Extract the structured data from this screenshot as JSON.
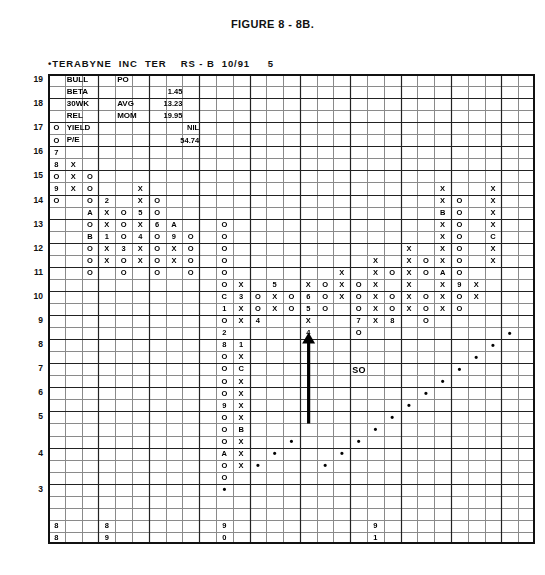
{
  "figure": {
    "title": "FIGURE 8 - 8B."
  },
  "chart_header": {
    "text": "•TERABYNE  INC  TER    RS - B  10/91     5",
    "symbol_marker": "•",
    "company": "TERABYNE",
    "type": "INC",
    "ticker": "TER",
    "relative_strength": "RS - B",
    "date": "10/91",
    "page": "5"
  },
  "stats_panel": {
    "rows": [
      {
        "label": "BULL",
        "mid": "PO",
        "value": ""
      },
      {
        "label": "BETA",
        "mid": "",
        "value": "1.45"
      },
      {
        "label": "30WK",
        "mid": "AVG",
        "value": "13.23"
      },
      {
        "label": "REL",
        "mid": "MOM",
        "value": "19.95"
      },
      {
        "label": "YIELD",
        "mid": "",
        "value": "NIL"
      },
      {
        "label": "P/E",
        "mid": "",
        "value": "54.74"
      }
    ]
  },
  "annotations": {
    "support_label": "SO",
    "arrow": "up-arrow"
  },
  "chart_data": {
    "type": "table",
    "xlabel": "Time (columns)",
    "ylabel": "Price",
    "grid": true,
    "columns": 29,
    "rows": 39,
    "y_axis_ticks": [
      {
        "label": "19",
        "row": 1
      },
      {
        "label": "18",
        "row": 3
      },
      {
        "label": "17",
        "row": 5
      },
      {
        "label": "16",
        "row": 7
      },
      {
        "label": "15",
        "row": 9
      },
      {
        "label": "14",
        "row": 11
      },
      {
        "label": "13",
        "row": 13
      },
      {
        "label": "12",
        "row": 15
      },
      {
        "label": "11",
        "row": 17
      },
      {
        "label": "10",
        "row": 19
      },
      {
        "label": "9",
        "row": 21
      },
      {
        "label": "8",
        "row": 23
      },
      {
        "label": "7",
        "row": 25
      },
      {
        "label": "6",
        "row": 27
      },
      {
        "label": "5",
        "row": 29
      },
      {
        "label": "4",
        "row": 32
      },
      {
        "label": "3",
        "row": 35
      }
    ],
    "year_markers": [
      {
        "col": 1,
        "top": "8",
        "bottom": "8"
      },
      {
        "col": 4,
        "top": "8",
        "bottom": "9"
      },
      {
        "col": 11,
        "top": "9",
        "bottom": "0"
      },
      {
        "col": 20,
        "top": "9",
        "bottom": "1"
      }
    ],
    "marks": [
      {
        "r": 1,
        "c": 2,
        "v": "BULL",
        "w": 2
      },
      {
        "r": 1,
        "c": 5,
        "v": "PO",
        "w": 2
      },
      {
        "r": 2,
        "c": 2,
        "v": "BETA",
        "w": 2
      },
      {
        "r": 2,
        "c": 7,
        "v": "1.45",
        "w": 2,
        "align": "right"
      },
      {
        "r": 3,
        "c": 2,
        "v": "30WK",
        "w": 2
      },
      {
        "r": 3,
        "c": 5,
        "v": "AVG",
        "w": 2
      },
      {
        "r": 3,
        "c": 7,
        "v": "13.23",
        "w": 2,
        "align": "right"
      },
      {
        "r": 4,
        "c": 2,
        "v": "REL",
        "w": 2
      },
      {
        "r": 4,
        "c": 5,
        "v": "MOM",
        "w": 2
      },
      {
        "r": 4,
        "c": 7,
        "v": "19.95",
        "w": 2,
        "align": "right"
      },
      {
        "r": 5,
        "c": 2,
        "v": "YIELD",
        "w": 2
      },
      {
        "r": 5,
        "c": 8,
        "v": "NIL",
        "w": 2,
        "align": "right"
      },
      {
        "r": 6,
        "c": 2,
        "v": "P/E",
        "w": 2
      },
      {
        "r": 6,
        "c": 8,
        "v": "54.74",
        "w": 2,
        "align": "right"
      },
      {
        "r": 5,
        "c": 1,
        "v": "O"
      },
      {
        "r": 6,
        "c": 1,
        "v": "O"
      },
      {
        "r": 7,
        "c": 1,
        "v": "7"
      },
      {
        "r": 8,
        "c": 1,
        "v": "8"
      },
      {
        "r": 8,
        "c": 2,
        "v": "X"
      },
      {
        "r": 9,
        "c": 1,
        "v": "O"
      },
      {
        "r": 9,
        "c": 2,
        "v": "X"
      },
      {
        "r": 9,
        "c": 3,
        "v": "O"
      },
      {
        "r": 10,
        "c": 1,
        "v": "9"
      },
      {
        "r": 10,
        "c": 2,
        "v": "X"
      },
      {
        "r": 10,
        "c": 3,
        "v": "O"
      },
      {
        "r": 10,
        "c": 6,
        "v": "X"
      },
      {
        "r": 11,
        "c": 1,
        "v": "O"
      },
      {
        "r": 11,
        "c": 3,
        "v": "O"
      },
      {
        "r": 11,
        "c": 4,
        "v": "2"
      },
      {
        "r": 11,
        "c": 6,
        "v": "X"
      },
      {
        "r": 11,
        "c": 7,
        "v": "O"
      },
      {
        "r": 12,
        "c": 3,
        "v": "A"
      },
      {
        "r": 12,
        "c": 4,
        "v": "X"
      },
      {
        "r": 12,
        "c": 5,
        "v": "O"
      },
      {
        "r": 12,
        "c": 6,
        "v": "5"
      },
      {
        "r": 12,
        "c": 7,
        "v": "O"
      },
      {
        "r": 13,
        "c": 3,
        "v": "O"
      },
      {
        "r": 13,
        "c": 4,
        "v": "X"
      },
      {
        "r": 13,
        "c": 5,
        "v": "O"
      },
      {
        "r": 13,
        "c": 6,
        "v": "X"
      },
      {
        "r": 13,
        "c": 7,
        "v": "6"
      },
      {
        "r": 13,
        "c": 8,
        "v": "A"
      },
      {
        "r": 14,
        "c": 3,
        "v": "B"
      },
      {
        "r": 14,
        "c": 4,
        "v": "1"
      },
      {
        "r": 14,
        "c": 5,
        "v": "O"
      },
      {
        "r": 14,
        "c": 6,
        "v": "4"
      },
      {
        "r": 14,
        "c": 7,
        "v": "O"
      },
      {
        "r": 14,
        "c": 8,
        "v": "9"
      },
      {
        "r": 14,
        "c": 9,
        "v": "O"
      },
      {
        "r": 15,
        "c": 3,
        "v": "O"
      },
      {
        "r": 15,
        "c": 4,
        "v": "X"
      },
      {
        "r": 15,
        "c": 5,
        "v": "3"
      },
      {
        "r": 15,
        "c": 6,
        "v": "X"
      },
      {
        "r": 15,
        "c": 7,
        "v": "O"
      },
      {
        "r": 15,
        "c": 8,
        "v": "X"
      },
      {
        "r": 15,
        "c": 9,
        "v": "O"
      },
      {
        "r": 16,
        "c": 3,
        "v": "O"
      },
      {
        "r": 16,
        "c": 4,
        "v": "X"
      },
      {
        "r": 16,
        "c": 5,
        "v": "O"
      },
      {
        "r": 16,
        "c": 6,
        "v": "X"
      },
      {
        "r": 16,
        "c": 7,
        "v": "O"
      },
      {
        "r": 16,
        "c": 8,
        "v": "X"
      },
      {
        "r": 16,
        "c": 9,
        "v": "O"
      },
      {
        "r": 17,
        "c": 3,
        "v": "O"
      },
      {
        "r": 17,
        "c": 5,
        "v": "O"
      },
      {
        "r": 17,
        "c": 7,
        "v": "O"
      },
      {
        "r": 17,
        "c": 9,
        "v": "O"
      },
      {
        "r": 10,
        "c": 24,
        "v": "X"
      },
      {
        "r": 10,
        "c": 27,
        "v": "X"
      },
      {
        "r": 11,
        "c": 24,
        "v": "X"
      },
      {
        "r": 11,
        "c": 25,
        "v": "O"
      },
      {
        "r": 11,
        "c": 27,
        "v": "X"
      },
      {
        "r": 12,
        "c": 24,
        "v": "B"
      },
      {
        "r": 12,
        "c": 25,
        "v": "O"
      },
      {
        "r": 12,
        "c": 27,
        "v": "X"
      },
      {
        "r": 13,
        "c": 24,
        "v": "X"
      },
      {
        "r": 13,
        "c": 25,
        "v": "O"
      },
      {
        "r": 13,
        "c": 27,
        "v": "X"
      },
      {
        "r": 14,
        "c": 24,
        "v": "X"
      },
      {
        "r": 14,
        "c": 25,
        "v": "O"
      },
      {
        "r": 14,
        "c": 27,
        "v": "C"
      },
      {
        "r": 15,
        "c": 22,
        "v": "X"
      },
      {
        "r": 15,
        "c": 24,
        "v": "X"
      },
      {
        "r": 15,
        "c": 25,
        "v": "O"
      },
      {
        "r": 15,
        "c": 27,
        "v": "X"
      },
      {
        "r": 16,
        "c": 20,
        "v": "X"
      },
      {
        "r": 16,
        "c": 22,
        "v": "X"
      },
      {
        "r": 16,
        "c": 23,
        "v": "O"
      },
      {
        "r": 16,
        "c": 24,
        "v": "X"
      },
      {
        "r": 16,
        "c": 25,
        "v": "O"
      },
      {
        "r": 16,
        "c": 27,
        "v": "X"
      },
      {
        "r": 17,
        "c": 18,
        "v": "X"
      },
      {
        "r": 17,
        "c": 20,
        "v": "X"
      },
      {
        "r": 17,
        "c": 21,
        "v": "O"
      },
      {
        "r": 17,
        "c": 22,
        "v": "X"
      },
      {
        "r": 17,
        "c": 23,
        "v": "O"
      },
      {
        "r": 17,
        "c": 24,
        "v": "A"
      },
      {
        "r": 17,
        "c": 25,
        "v": "O"
      },
      {
        "r": 18,
        "c": 16,
        "v": "X"
      },
      {
        "r": 18,
        "c": 17,
        "v": "O"
      },
      {
        "r": 18,
        "c": 18,
        "v": "X"
      },
      {
        "r": 18,
        "c": 19,
        "v": "O"
      },
      {
        "r": 18,
        "c": 20,
        "v": "X"
      },
      {
        "r": 18,
        "c": 22,
        "v": "X"
      },
      {
        "r": 18,
        "c": 24,
        "v": "X"
      },
      {
        "r": 18,
        "c": 25,
        "v": "9"
      },
      {
        "r": 18,
        "c": 26,
        "v": "X"
      },
      {
        "r": 19,
        "c": 16,
        "v": "6"
      },
      {
        "r": 19,
        "c": 17,
        "v": "O"
      },
      {
        "r": 19,
        "c": 18,
        "v": "X"
      },
      {
        "r": 19,
        "c": 19,
        "v": "O"
      },
      {
        "r": 19,
        "c": 20,
        "v": "X"
      },
      {
        "r": 19,
        "c": 21,
        "v": "O"
      },
      {
        "r": 19,
        "c": 22,
        "v": "X"
      },
      {
        "r": 19,
        "c": 23,
        "v": "O"
      },
      {
        "r": 19,
        "c": 24,
        "v": "X"
      },
      {
        "r": 19,
        "c": 25,
        "v": "O"
      },
      {
        "r": 19,
        "c": 26,
        "v": "X"
      },
      {
        "r": 20,
        "c": 16,
        "v": "5"
      },
      {
        "r": 20,
        "c": 17,
        "v": "O"
      },
      {
        "r": 20,
        "c": 19,
        "v": "O"
      },
      {
        "r": 20,
        "c": 20,
        "v": "X"
      },
      {
        "r": 20,
        "c": 21,
        "v": "O"
      },
      {
        "r": 20,
        "c": 22,
        "v": "X"
      },
      {
        "r": 20,
        "c": 23,
        "v": "O"
      },
      {
        "r": 20,
        "c": 24,
        "v": "X"
      },
      {
        "r": 20,
        "c": 25,
        "v": "O"
      },
      {
        "r": 21,
        "c": 16,
        "v": "X"
      },
      {
        "r": 21,
        "c": 19,
        "v": "7"
      },
      {
        "r": 21,
        "c": 20,
        "v": "X"
      },
      {
        "r": 21,
        "c": 21,
        "v": "8"
      },
      {
        "r": 21,
        "c": 23,
        "v": "O"
      },
      {
        "r": 22,
        "c": 16,
        "v": "4"
      },
      {
        "r": 22,
        "c": 19,
        "v": "O"
      },
      {
        "r": 13,
        "c": 11,
        "v": "O"
      },
      {
        "r": 14,
        "c": 11,
        "v": "O"
      },
      {
        "r": 15,
        "c": 11,
        "v": "O"
      },
      {
        "r": 16,
        "c": 11,
        "v": "O"
      },
      {
        "r": 17,
        "c": 11,
        "v": "O"
      },
      {
        "r": 18,
        "c": 11,
        "v": "O"
      },
      {
        "r": 18,
        "c": 12,
        "v": "X"
      },
      {
        "r": 18,
        "c": 14,
        "v": "5"
      },
      {
        "r": 19,
        "c": 11,
        "v": "C"
      },
      {
        "r": 19,
        "c": 12,
        "v": "3"
      },
      {
        "r": 19,
        "c": 13,
        "v": "O"
      },
      {
        "r": 19,
        "c": 14,
        "v": "X"
      },
      {
        "r": 19,
        "c": 15,
        "v": "O"
      },
      {
        "r": 20,
        "c": 11,
        "v": "1"
      },
      {
        "r": 20,
        "c": 12,
        "v": "X"
      },
      {
        "r": 20,
        "c": 13,
        "v": "O"
      },
      {
        "r": 20,
        "c": 14,
        "v": "X"
      },
      {
        "r": 20,
        "c": 15,
        "v": "O"
      },
      {
        "r": 21,
        "c": 11,
        "v": "O"
      },
      {
        "r": 21,
        "c": 12,
        "v": "X"
      },
      {
        "r": 21,
        "c": 13,
        "v": "4"
      },
      {
        "r": 22,
        "c": 11,
        "v": "2"
      },
      {
        "r": 23,
        "c": 11,
        "v": "8"
      },
      {
        "r": 23,
        "c": 12,
        "v": "1"
      },
      {
        "r": 24,
        "c": 11,
        "v": "O"
      },
      {
        "r": 24,
        "c": 12,
        "v": "X"
      },
      {
        "r": 25,
        "c": 11,
        "v": "O"
      },
      {
        "r": 25,
        "c": 12,
        "v": "C"
      },
      {
        "r": 26,
        "c": 11,
        "v": "O"
      },
      {
        "r": 26,
        "c": 12,
        "v": "X"
      },
      {
        "r": 27,
        "c": 11,
        "v": "O"
      },
      {
        "r": 27,
        "c": 12,
        "v": "X"
      },
      {
        "r": 28,
        "c": 11,
        "v": "9"
      },
      {
        "r": 28,
        "c": 12,
        "v": "X"
      },
      {
        "r": 29,
        "c": 11,
        "v": "O"
      },
      {
        "r": 29,
        "c": 12,
        "v": "X"
      },
      {
        "r": 30,
        "c": 11,
        "v": "O"
      },
      {
        "r": 30,
        "c": 12,
        "v": "B"
      },
      {
        "r": 31,
        "c": 11,
        "v": "O"
      },
      {
        "r": 31,
        "c": 12,
        "v": "X"
      },
      {
        "r": 32,
        "c": 11,
        "v": "A"
      },
      {
        "r": 32,
        "c": 12,
        "v": "X"
      },
      {
        "r": 33,
        "c": 11,
        "v": "O"
      },
      {
        "r": 33,
        "c": 12,
        "v": "X"
      },
      {
        "r": 34,
        "c": 11,
        "v": "O"
      },
      {
        "r": 35,
        "c": 11,
        "v": "•"
      },
      {
        "r": 22,
        "c": 28,
        "v": "•"
      },
      {
        "r": 23,
        "c": 27,
        "v": "•"
      },
      {
        "r": 24,
        "c": 26,
        "v": "•"
      },
      {
        "r": 25,
        "c": 25,
        "v": "•"
      },
      {
        "r": 26,
        "c": 24,
        "v": "•"
      },
      {
        "r": 27,
        "c": 23,
        "v": "•"
      },
      {
        "r": 28,
        "c": 22,
        "v": "•"
      },
      {
        "r": 29,
        "c": 21,
        "v": "•"
      },
      {
        "r": 30,
        "c": 20,
        "v": "•"
      },
      {
        "r": 31,
        "c": 19,
        "v": "•"
      },
      {
        "r": 32,
        "c": 18,
        "v": "•"
      },
      {
        "r": 33,
        "c": 17,
        "v": "•"
      },
      {
        "r": 33,
        "c": 13,
        "v": "•"
      },
      {
        "r": 32,
        "c": 14,
        "v": "•"
      },
      {
        "r": 31,
        "c": 15,
        "v": "•"
      }
    ]
  }
}
